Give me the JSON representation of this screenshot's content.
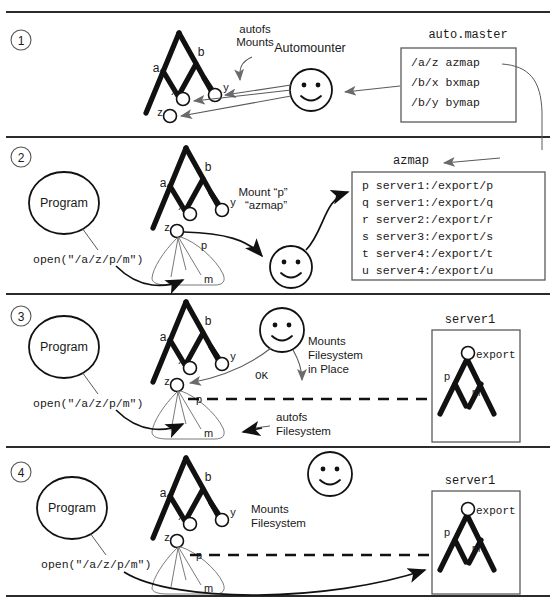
{
  "diagram": {
    "panels": [
      {
        "number": "1",
        "labels": {
          "autofs_mounts": [
            "autofs",
            "Mounts"
          ],
          "automounter": "Automounter",
          "map_title": "auto.master",
          "map_lines": [
            "/a/z azmap",
            "/b/x bxmap",
            "/b/y bymap"
          ],
          "tree_nodes": [
            "a",
            "b",
            "x",
            "y",
            "z"
          ]
        }
      },
      {
        "number": "2",
        "labels": {
          "program": "Program",
          "open_call": "open(\"/a/z/p/m\")",
          "mount_line1": "Mount “p”",
          "mount_line2": "“azmap”",
          "map_title": "azmap",
          "map_lines": [
            "p server1:/export/p",
            "q server1:/export/q",
            "r server2:/export/r",
            "s server3:/export/s",
            "t server4:/export/t",
            "u server4:/export/u"
          ],
          "tree_nodes": [
            "a",
            "b",
            "x",
            "y",
            "z"
          ],
          "autofs_nodes": [
            "p",
            "m"
          ]
        }
      },
      {
        "number": "3",
        "labels": {
          "program": "Program",
          "open_call": "open(\"/a/z/p/m\")",
          "ok": "OK",
          "mounts_in_place": [
            "Mounts",
            "Filesystem",
            "in Place"
          ],
          "autofs_fs": [
            "autofs",
            "Filesystem"
          ],
          "server_title": "server1",
          "server_nodes": [
            "export",
            "p",
            "m"
          ],
          "tree_nodes": [
            "a",
            "b",
            "x",
            "y",
            "z"
          ],
          "autofs_nodes": [
            "p",
            "m"
          ]
        }
      },
      {
        "number": "4",
        "labels": {
          "program": "Program",
          "open_call": "open(\"/a/z/p/m\")",
          "mounts_fs": [
            "Mounts",
            "Filesystem"
          ],
          "server_title": "server1",
          "server_nodes": [
            "export",
            "p",
            "m"
          ],
          "tree_nodes": [
            "a",
            "b",
            "x",
            "y",
            "z"
          ],
          "autofs_nodes": [
            "p",
            "m"
          ]
        }
      }
    ],
    "colors": {
      "ink": "#111111",
      "line": "#5a5a5a",
      "background": "#ffffff"
    }
  }
}
